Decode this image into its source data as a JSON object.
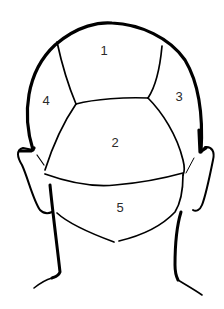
{
  "diagram": {
    "regions": [
      {
        "id": 1,
        "label": "1",
        "name": "crown-top-region",
        "x": 104,
        "y": 50
      },
      {
        "id": 2,
        "label": "2",
        "name": "occipital-center-region",
        "x": 115,
        "y": 142
      },
      {
        "id": 3,
        "label": "3",
        "name": "right-side-region",
        "x": 179,
        "y": 96
      },
      {
        "id": 4,
        "label": "4",
        "name": "left-side-region",
        "x": 46,
        "y": 100
      },
      {
        "id": 5,
        "label": "5",
        "name": "nape-region",
        "x": 120,
        "y": 207
      }
    ],
    "colors": {
      "line": "#000000",
      "label": "#2a2a2a",
      "background": "#ffffff"
    }
  }
}
